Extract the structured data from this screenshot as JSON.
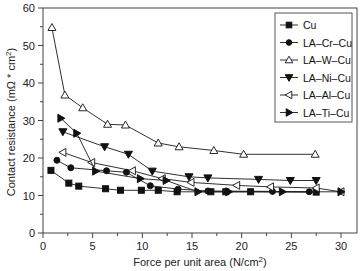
{
  "chart_data": {
    "type": "line",
    "title": "",
    "xlabel": "Force per unit area (N/cm²)",
    "ylabel": "Contact resistance (mΩ * cm²)",
    "xlim": [
      0,
      30
    ],
    "ylim": [
      0,
      60
    ],
    "x_ticks": [
      0,
      5,
      10,
      15,
      20,
      25,
      30
    ],
    "y_ticks": [
      0,
      10,
      20,
      30,
      40,
      50,
      60
    ],
    "grid": false,
    "legend_position": "upper right",
    "series": [
      {
        "name": "Cu",
        "marker": "square-filled",
        "x": [
          0.8,
          2.6,
          3.6,
          6.3,
          7.8,
          9.9,
          11.6,
          13.5,
          16.9,
          18.4,
          20.9,
          27.5
        ],
        "y": [
          16.7,
          13.3,
          12.5,
          11.8,
          11.4,
          11.4,
          11.4,
          11.0,
          11.0,
          11.0,
          11.0,
          10.9
        ]
      },
      {
        "name": "LA-Cr-Cu",
        "marker": "circle-filled",
        "x": [
          1.4,
          2.8,
          6.4,
          8.4,
          10.8,
          13.6,
          16.6,
          23.1,
          26.8
        ],
        "y": [
          19.4,
          17.4,
          16.6,
          16.2,
          12.6,
          11.7,
          11.2,
          11.1,
          11.0
        ]
      },
      {
        "name": "LA-W-Cu",
        "marker": "triangle-up-open",
        "x": [
          0.9,
          2.2,
          4.0,
          6.5,
          8.3,
          11.6,
          13.7,
          17.2,
          20.2,
          27.4
        ],
        "y": [
          54.8,
          36.8,
          33.4,
          29.0,
          28.8,
          24.0,
          23.0,
          22.0,
          21.0,
          21.0
        ]
      },
      {
        "name": "LA-Ni-Cu",
        "marker": "triangle-down-filled",
        "x": [
          2.0,
          6.2,
          8.6,
          11.0,
          14.7,
          16.6,
          21.7,
          24.9,
          27.5
        ],
        "y": [
          27.0,
          23.0,
          21.0,
          16.5,
          15.0,
          14.7,
          14.3,
          14.0,
          14.0
        ]
      },
      {
        "name": "LA-Al-Cu",
        "marker": "triangle-left-open",
        "x": [
          2.0,
          4.9,
          9.0,
          12.0,
          14.9,
          19.5,
          22.9,
          27.5,
          30.0
        ],
        "y": [
          21.5,
          18.8,
          16.6,
          14.5,
          13.5,
          12.7,
          12.3,
          12.0,
          11.0
        ]
      },
      {
        "name": "LA-Ti-Cu",
        "marker": "triangle-right-filled",
        "x": [
          1.8,
          3.4,
          5.3,
          9.8,
          12.4,
          15.6,
          18.7,
          24.1,
          30.0
        ],
        "y": [
          30.6,
          26.6,
          16.5,
          14.5,
          14.0,
          11.0,
          11.0,
          11.0,
          11.0
        ]
      }
    ]
  },
  "legend": {
    "items": [
      "Cu",
      "LA–Cr–Cu",
      "LA–W–Cu",
      "LA–Ni–Cu",
      "LA–Al–Cu",
      "LA–Ti–Cu"
    ]
  },
  "axes": {
    "xlabel_main": "Force per unit area (N/cm",
    "xlabel_sup": "2",
    "xlabel_end": ")",
    "ylabel_main": "Contact resistance (mΩ * cm",
    "ylabel_sup": "2",
    "ylabel_end": ")"
  },
  "colors": {
    "line": "#1a1a1a",
    "marker_fill": "#111111",
    "frame": "#444444"
  }
}
